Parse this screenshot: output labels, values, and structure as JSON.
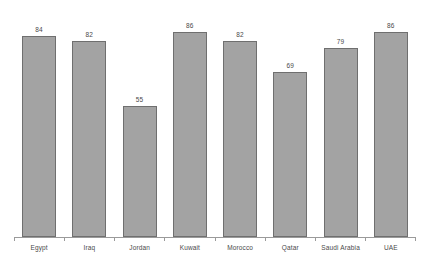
{
  "chart_data": {
    "type": "bar",
    "title": "",
    "subtitle": "",
    "xlabel": "",
    "ylabel": "",
    "categories": [
      "Egypt",
      "Iraq",
      "Jordan",
      "Kuwait",
      "Morocco",
      "Qatar",
      "Saudi Arabia",
      "UAE"
    ],
    "values": [
      84,
      82,
      55,
      86,
      82,
      69,
      79,
      86
    ],
    "value_labels": [
      "84",
      "82",
      "55",
      "86",
      "82",
      "69",
      "79",
      "86"
    ],
    "ylim": [
      0,
      90
    ],
    "grid": false,
    "legend": false,
    "legend_position": "none",
    "y_axis_visible": false,
    "x_axis_visible": true,
    "data_labels_visible": true,
    "colors": {
      "bar_fill": "#a3a3a3",
      "bar_stroke": "#6f6f6f",
      "axis_line": "#9a9a9a",
      "label_text": "#4a4a4a",
      "background": "#ffffff"
    }
  }
}
